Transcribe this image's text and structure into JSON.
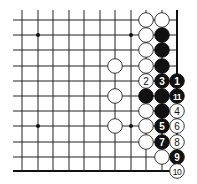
{
  "diagram": {
    "title": "",
    "board": {
      "columns_x": [
        22,
        38,
        53,
        69,
        84,
        100,
        115,
        131,
        146,
        162,
        177
      ],
      "rows_y": [
        20,
        35,
        50,
        66,
        81,
        96,
        111,
        126,
        142,
        157,
        171
      ],
      "left_extent": 13,
      "top_extent": 10,
      "right_edge": true,
      "bottom_edge": true,
      "stone_radius": 7.3
    },
    "star_points": [
      {
        "c": 1,
        "r": 1
      },
      {
        "c": 7,
        "r": 1
      },
      {
        "c": 1,
        "r": 7
      },
      {
        "c": 7,
        "r": 7
      }
    ],
    "stones": [
      {
        "c": 8,
        "r": 0,
        "color": "white",
        "label": ""
      },
      {
        "c": 9,
        "r": 0,
        "color": "white",
        "label": ""
      },
      {
        "c": 8,
        "r": 1,
        "color": "white",
        "label": ""
      },
      {
        "c": 9,
        "r": 1,
        "color": "black",
        "label": ""
      },
      {
        "c": 8,
        "r": 2,
        "color": "white",
        "label": ""
      },
      {
        "c": 9,
        "r": 2,
        "color": "black",
        "label": ""
      },
      {
        "c": 6,
        "r": 3,
        "color": "white",
        "label": ""
      },
      {
        "c": 8,
        "r": 3,
        "color": "white",
        "label": ""
      },
      {
        "c": 9,
        "r": 3,
        "color": "black",
        "label": ""
      },
      {
        "c": 8,
        "r": 4,
        "color": "white",
        "label": "2"
      },
      {
        "c": 9,
        "r": 4,
        "color": "black",
        "label": "3"
      },
      {
        "c": 10,
        "r": 4,
        "color": "black",
        "label": "1"
      },
      {
        "c": 6,
        "r": 5,
        "color": "white",
        "label": ""
      },
      {
        "c": 8,
        "r": 5,
        "color": "black",
        "label": ""
      },
      {
        "c": 9,
        "r": 5,
        "color": "black",
        "label": ""
      },
      {
        "c": 10,
        "r": 5,
        "color": "black",
        "label": "11"
      },
      {
        "c": 8,
        "r": 6,
        "color": "white",
        "label": ""
      },
      {
        "c": 9,
        "r": 6,
        "color": "black",
        "label": ""
      },
      {
        "c": 10,
        "r": 6,
        "color": "white",
        "label": "4"
      },
      {
        "c": 6,
        "r": 7,
        "color": "white",
        "label": ""
      },
      {
        "c": 8,
        "r": 7,
        "color": "white",
        "label": ""
      },
      {
        "c": 9,
        "r": 7,
        "color": "black",
        "label": "5"
      },
      {
        "c": 10,
        "r": 7,
        "color": "white",
        "label": "6"
      },
      {
        "c": 8,
        "r": 8,
        "color": "white",
        "label": ""
      },
      {
        "c": 9,
        "r": 8,
        "color": "black",
        "label": "7"
      },
      {
        "c": 10,
        "r": 8,
        "color": "white",
        "label": "8"
      },
      {
        "c": 9,
        "r": 9,
        "color": "white",
        "label": ""
      },
      {
        "c": 10,
        "r": 9,
        "color": "black",
        "label": "9"
      },
      {
        "c": 10,
        "r": 10,
        "color": "white",
        "label": "10"
      }
    ]
  }
}
